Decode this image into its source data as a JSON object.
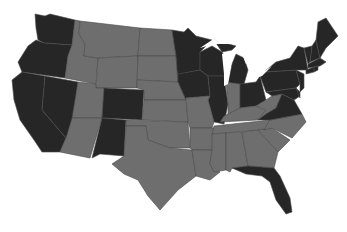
{
  "map": {
    "type": "us-states-choropleth",
    "background": "#ffffff",
    "colors": {
      "dark": "#262626",
      "gray": "#6e6e6e",
      "border": "#4a4a4a"
    },
    "dark_states": [
      "WA",
      "OR",
      "CA",
      "NV",
      "CO",
      "NM",
      "MN",
      "WI",
      "IA",
      "IL",
      "MI",
      "OH",
      "PA",
      "NY",
      "VT",
      "NH",
      "ME",
      "MA",
      "CT",
      "RI",
      "NJ",
      "DE",
      "MD",
      "VA",
      "FL"
    ],
    "gray_states": [
      "ID",
      "MT",
      "WY",
      "UT",
      "AZ",
      "ND",
      "SD",
      "NE",
      "KS",
      "OK",
      "TX",
      "MO",
      "AR",
      "LA",
      "IN",
      "KY",
      "TN",
      "MS",
      "AL",
      "GA",
      "SC",
      "NC",
      "WV"
    ]
  }
}
